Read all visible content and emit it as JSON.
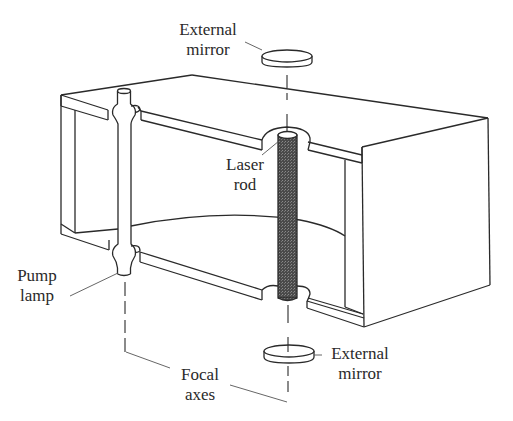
{
  "figure": {
    "type": "laser-cavity-cutaway",
    "colors": {
      "line": "#2a2a2a",
      "rod_fill": "#555555",
      "background": "#ffffff"
    }
  },
  "labels": {
    "external_mirror_top": {
      "line1": "External",
      "line2": "mirror"
    },
    "laser_rod": {
      "line1": "Laser",
      "line2": "rod"
    },
    "pump_lamp": {
      "line1": "Pump",
      "line2": "lamp"
    },
    "external_mirror_bottom": {
      "line1": "External",
      "line2": "mirror"
    },
    "focal_axes": {
      "line1": "Focal",
      "line2": "axes"
    }
  }
}
